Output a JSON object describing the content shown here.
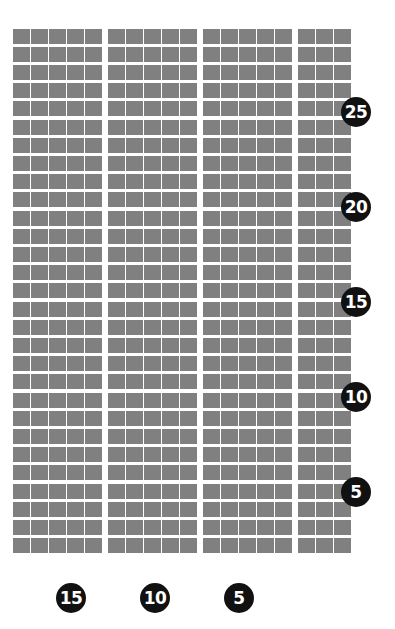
{
  "chart_data": {
    "type": "heatmap",
    "title": "",
    "subtitle": "",
    "xlabel": "",
    "ylabel": "",
    "grid": true,
    "legend": "none",
    "columns": 18,
    "rows": 29,
    "group_size": 5,
    "cell_color": "#808080",
    "background_color": "#ffffff",
    "total_cells": 522,
    "x_axis": {
      "orientation": "bottom",
      "direction": "right-to-left",
      "ticks": [
        {
          "label": "15",
          "column_index": 4
        },
        {
          "label": "10",
          "column_index": 9
        },
        {
          "label": "5",
          "column_index": 14
        }
      ],
      "tick_values": [
        15,
        10,
        5
      ],
      "range": [
        18,
        1
      ]
    },
    "y_axis": {
      "orientation": "right",
      "direction": "top-to-bottom-descending",
      "ticks": [
        {
          "label": "25",
          "row_index": 4
        },
        {
          "label": "20",
          "row_index": 9
        },
        {
          "label": "15",
          "row_index": 14
        },
        {
          "label": "10",
          "row_index": 19
        },
        {
          "label": "5",
          "row_index": 24
        }
      ],
      "tick_values": [
        25,
        20,
        15,
        10,
        5
      ],
      "range": [
        29,
        1
      ]
    },
    "series": [
      {
        "name": "cells",
        "values": [
          18,
          18,
          18,
          18,
          18,
          18,
          18,
          18,
          18,
          18,
          18,
          18,
          18,
          18,
          18,
          18,
          18,
          18,
          18,
          18,
          18,
          18,
          18,
          18,
          18,
          18,
          18,
          18,
          18
        ]
      }
    ]
  },
  "badges": {
    "y_axis": [
      {
        "label": "25",
        "top": 97
      },
      {
        "top": 192,
        "label": "20"
      },
      {
        "label": "15",
        "top": 287
      },
      {
        "label": "10",
        "top": 382
      },
      {
        "label": "5",
        "top": 477
      }
    ],
    "x_axis": [
      {
        "label": "15",
        "left": 56
      },
      {
        "label": "10",
        "left": 140
      },
      {
        "label": "5",
        "left": 224
      }
    ]
  },
  "style": {
    "cell_color": "#808080",
    "badge_color": "#111111",
    "badge_text_color": "#ffffff",
    "page_background": "#ffffff"
  }
}
